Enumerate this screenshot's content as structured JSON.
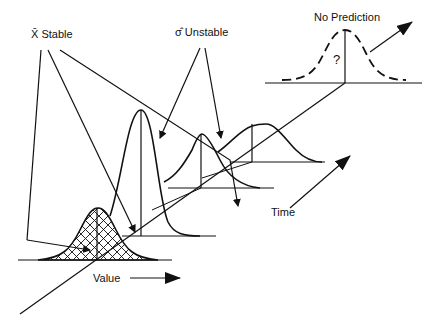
{
  "diagram": {
    "labels": {
      "xbar_stable": "X̄ Stable",
      "sigma_unstable": "σ̂ Unstable",
      "no_prediction": "No Prediction",
      "question_mark": "?",
      "value_axis": "Value",
      "time_axis": "Time"
    },
    "distributions": [
      {
        "name": "hatched-baseline",
        "style": "crosshatch"
      },
      {
        "name": "tall-narrow",
        "style": "solid"
      },
      {
        "name": "medium",
        "style": "solid"
      },
      {
        "name": "wide",
        "style": "solid"
      },
      {
        "name": "no-prediction",
        "style": "dashed"
      }
    ],
    "colors": {
      "stroke": "#111111",
      "background": "#ffffff"
    }
  }
}
